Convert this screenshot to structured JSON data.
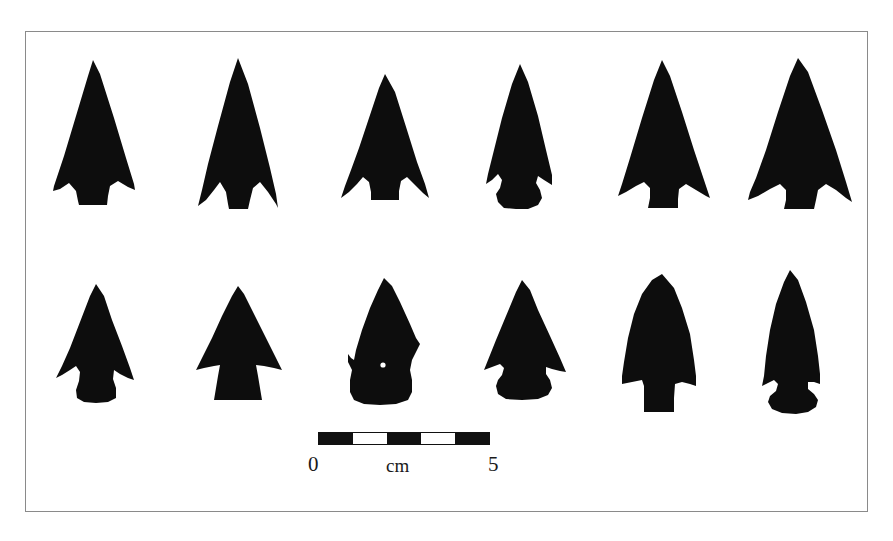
{
  "figure": {
    "type": "archaeological-plate",
    "frame": {
      "border_color": "#8a8a8a",
      "background_color": "#ffffff"
    },
    "silhouette_color": "#0d0d0d"
  },
  "scale_bar": {
    "start_label": "0",
    "unit_label": "cm",
    "end_label": "5",
    "segments": 5,
    "segment_length_cm": 1,
    "total_length_cm": 5,
    "segment_colors": [
      "dark",
      "light",
      "dark",
      "light",
      "dark"
    ],
    "bar_color": "#111111"
  },
  "specimens": {
    "rows": 2,
    "columns": 6,
    "total": 12,
    "row_1": [
      {
        "id": "point-1",
        "label": "a",
        "form": "corner-notched triangular point with expanding stem"
      },
      {
        "id": "point-2",
        "label": "b",
        "form": "narrow triangular point with sharp barbs and expanding stem"
      },
      {
        "id": "point-3",
        "label": "c",
        "form": "short corner-notched point with rounded stem base"
      },
      {
        "id": "point-4",
        "label": "d",
        "form": "side-notched point with flaring basal ears"
      },
      {
        "id": "point-5",
        "label": "e",
        "form": "broad corner-notched point with pronounced barbs"
      },
      {
        "id": "point-6",
        "label": "f",
        "form": "large corner-notched point with asymmetric barbs"
      }
    ],
    "row_2": [
      {
        "id": "point-7",
        "label": "g",
        "form": "small barbed point with rounded contracting stem"
      },
      {
        "id": "point-8",
        "label": "h",
        "form": "shouldered point with broad trapezoidal stem"
      },
      {
        "id": "point-9",
        "label": "i",
        "form": "ogival leaf-shaped point with weak asymmetric shoulders"
      },
      {
        "id": "point-10",
        "label": "j",
        "form": "deeply side-notched point with expanding base"
      },
      {
        "id": "point-11",
        "label": "k",
        "form": "round-shouldered point with narrow rectangular stem"
      },
      {
        "id": "point-12",
        "label": "l",
        "form": "elongated narrow point with flaring base"
      }
    ]
  }
}
